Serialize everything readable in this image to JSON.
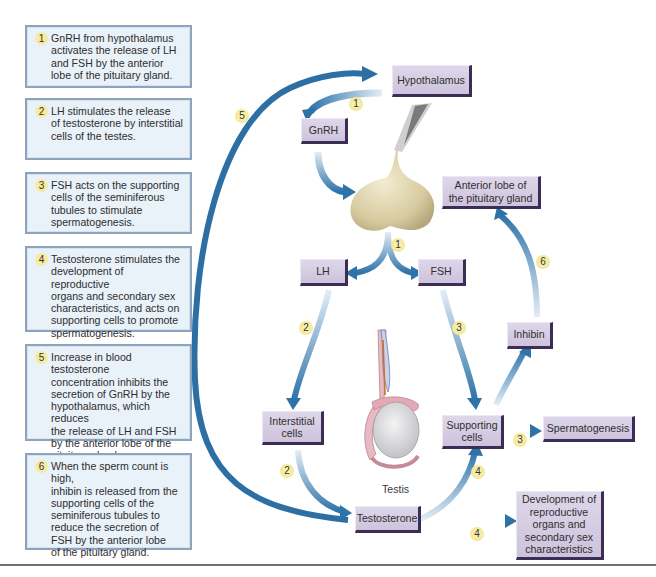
{
  "steps": [
    {
      "num": "1",
      "text": "GnRH from hypothalamus\nactivates the release of LH\nand FSH by the anterior\nlobe of the pituitary gland."
    },
    {
      "num": "2",
      "text": "LH stimulates the release\nof testosterone by interstitial\ncells of the testes."
    },
    {
      "num": "3",
      "text": "FSH acts on the supporting\ncells of the seminiferous\ntubules to stimulate\nspermatogenesis."
    },
    {
      "num": "4",
      "text": "Testosterone stimulates the\ndevelopment of reproductive\norgans and secondary sex\ncharacteristics, and acts on\nsupporting cells to promote\nspermatogenesis."
    },
    {
      "num": "5",
      "text": "Increase in blood testosterone\nconcentration inhibits the\nsecretion of GnRH by the\nhypothalamus, which reduces\nthe release of LH and FSH\nby the anterior lobe of the\npituitary gland."
    },
    {
      "num": "6",
      "text": "When the sperm count is high,\ninhibin is released from the\nsupporting cells of the\nseminiferous tubules to\nreduce the secretion of\nFSH by the anterior lobe\nof the pituitary gland."
    }
  ],
  "nodes": {
    "hypothalamus": "Hypothalamus",
    "gnrh": "GnRH",
    "anterior_pituitary": "Anterior lobe of\nthe pituitary gland",
    "lh": "LH",
    "fsh": "FSH",
    "inhibin": "Inhibin",
    "interstitial_cells": "Interstitial\ncells",
    "supporting_cells": "Supporting\ncells",
    "spermatogenesis": "Spermatogenesis",
    "testosterone": "Testosterone",
    "development": "Development of\nreproductive\norgans and\nsecondary sex\ncharacteristics"
  },
  "captions": {
    "testis": "Testis"
  },
  "badges": {
    "b5": "5",
    "b1_top": "1",
    "b1_mid": "1",
    "b6": "6",
    "b2_upper": "2",
    "b3_upper": "3",
    "b3_lower": "3",
    "b4_upper": "4",
    "b2_lower": "2",
    "b4_lower": "4"
  },
  "colors": {
    "arrow_dark": "#2d6fa3",
    "arrow_light": "#c9dcec",
    "node_fill": "#d6cee4",
    "node_shadow": "#3c2d56",
    "step_fill": "#e9f1f9",
    "step_border": "#8ea4bd",
    "badge_fill": "#f6eba0"
  }
}
